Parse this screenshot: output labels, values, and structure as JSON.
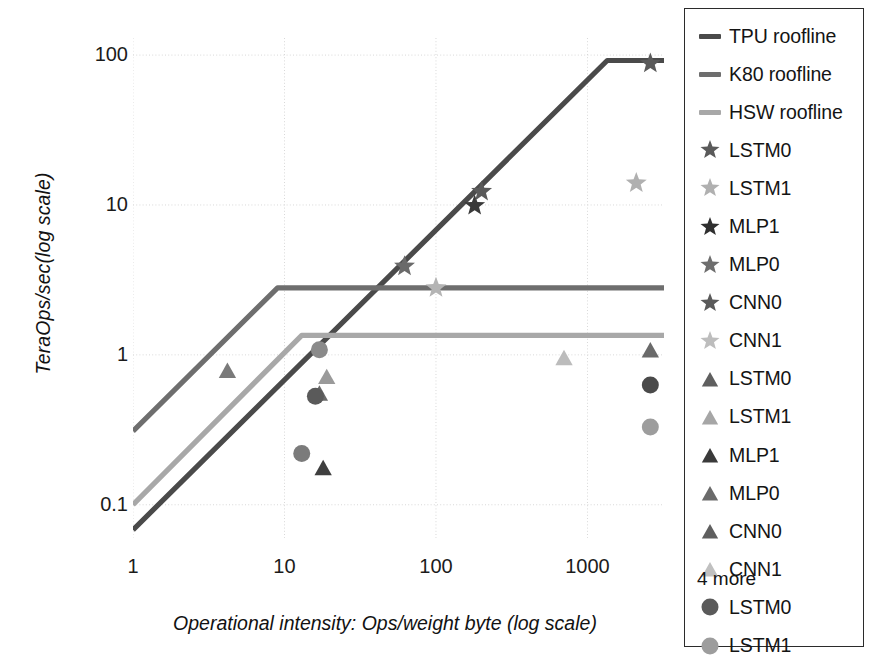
{
  "chart_data": {
    "type": "line",
    "title": "",
    "xlabel": "Operational intensity: Ops/weight byte (log scale)",
    "ylabel": "TeraOps/sec(log scale)",
    "xscale": "log",
    "yscale": "log",
    "xlim": [
      1,
      3200
    ],
    "ylim": [
      0.06,
      130
    ],
    "xticks": [
      "1",
      "10",
      "100",
      "1000"
    ],
    "xtick_values": [
      1,
      10,
      100,
      1000
    ],
    "yticks": [
      "100",
      "10",
      "1",
      "0.1"
    ],
    "ytick_values": [
      100,
      10,
      1,
      0.1
    ],
    "grid": true,
    "legend_position": "right-outside",
    "rooflines": [
      {
        "name": "TPU roofline",
        "color": "#4a4a4a",
        "peak": 92,
        "ridge_x": 1350,
        "slope_start": [
          1,
          0.068
        ],
        "knee": [
          1350,
          92
        ],
        "end": [
          3200,
          92
        ]
      },
      {
        "name": "K80 roofline",
        "color": "#6e6e6e",
        "peak": 2.8,
        "ridge_x": 9,
        "slope_start": [
          1,
          0.31
        ],
        "knee": [
          9,
          2.8
        ],
        "end": [
          3200,
          2.8
        ]
      },
      {
        "name": "HSW roofline",
        "color": "#a8a8a8",
        "peak": 1.35,
        "ridge_x": 13,
        "slope_start": [
          1,
          0.1
        ],
        "knee": [
          13,
          1.35
        ],
        "end": [
          3200,
          1.35
        ]
      }
    ],
    "series": [
      {
        "name": "LSTM0",
        "marker": "star",
        "platform": "TPU",
        "color": "#5a5a5a",
        "points": [
          [
            2600,
            88
          ]
        ]
      },
      {
        "name": "LSTM1",
        "marker": "star",
        "platform": "TPU",
        "color": "#b0b0b0",
        "points": [
          [
            2100,
            14
          ]
        ]
      },
      {
        "name": "MLP1",
        "marker": "star",
        "platform": "TPU",
        "color": "#3a3a3a",
        "points": [
          [
            180,
            9.9
          ]
        ]
      },
      {
        "name": "MLP0",
        "marker": "star",
        "platform": "TPU",
        "color": "#5a5a5a",
        "points": [
          [
            200,
            12.3
          ]
        ]
      },
      {
        "name": "CNN0",
        "marker": "star",
        "platform": "TPU",
        "color": "#6a6a6a",
        "points": [
          [
            62,
            3.9
          ]
        ]
      },
      {
        "name": "CNN1",
        "marker": "star",
        "platform": "TPU",
        "color": "#b4b4b4",
        "points": [
          [
            100,
            2.8
          ]
        ]
      },
      {
        "name": "LSTM0",
        "marker": "triangle",
        "platform": "HSW",
        "color": "#6a6a6a",
        "points": [
          [
            17,
            0.55
          ]
        ]
      },
      {
        "name": "LSTM1",
        "marker": "triangle",
        "platform": "HSW",
        "color": "#9a9a9a",
        "points": [
          [
            19,
            0.71
          ]
        ]
      },
      {
        "name": "MLP1",
        "marker": "triangle",
        "platform": "HSW",
        "color": "#3f3f3f",
        "points": [
          [
            18,
            0.175
          ]
        ]
      },
      {
        "name": "MLP0",
        "marker": "triangle",
        "platform": "HSW",
        "color": "#6a6a6a",
        "points": [
          [
            2600,
            1.07
          ]
        ]
      },
      {
        "name": "CNN0",
        "marker": "triangle",
        "platform": "HSW",
        "color": "#7a7a7a",
        "points": [
          [
            4.2,
            0.78
          ]
        ]
      },
      {
        "name": "CNN1",
        "marker": "triangle",
        "platform": "HSW",
        "color": "#bcbcbc",
        "points": [
          [
            700,
            0.95
          ]
        ]
      },
      {
        "name": "LSTM0",
        "marker": "circle",
        "platform": "K80",
        "color": "#4a4a4a",
        "points": [
          [
            2600,
            0.63
          ]
        ]
      },
      {
        "name": "LSTM1",
        "marker": "circle",
        "platform": "K80",
        "color": "#9d9d9d",
        "points": [
          [
            2600,
            0.33
          ]
        ]
      },
      {
        "name": "MLP1",
        "marker": "circle",
        "platform": "K80",
        "color": "#5a5a5a",
        "points": [
          [
            16,
            0.53
          ]
        ]
      },
      {
        "name": "MLP0",
        "marker": "circle",
        "platform": "K80",
        "color": "#7b7b7b",
        "points": [
          [
            13,
            0.22
          ]
        ]
      },
      {
        "name": "CNN0",
        "marker": "circle",
        "platform": "K80",
        "color": "#8a8a8a",
        "points": [
          [
            17,
            1.08
          ]
        ]
      }
    ]
  },
  "axis": {
    "ylabel": "TeraOps/sec(log scale)",
    "xlabel": "Operational intensity: Ops/weight byte (log scale)",
    "yticks": [
      "100",
      "10",
      "1",
      "0.1"
    ],
    "xticks": [
      "1",
      "10",
      "100",
      "1000"
    ]
  },
  "legend": {
    "more_label": "4 more",
    "items": [
      {
        "label": "TPU roofline",
        "key": "line-swatch",
        "color": "#4a4a4a"
      },
      {
        "label": "K80 roofline",
        "key": "line-swatch",
        "color": "#6e6e6e"
      },
      {
        "label": "HSW roofline",
        "key": "line-swatch",
        "color": "#a8a8a8"
      },
      {
        "label": "LSTM0",
        "key": "star-marker",
        "color": "#5a5a5a"
      },
      {
        "label": "LSTM1",
        "key": "star-marker",
        "color": "#b0b0b0"
      },
      {
        "label": "MLP1",
        "key": "star-marker",
        "color": "#2f2f2f"
      },
      {
        "label": "MLP0",
        "key": "star-marker",
        "color": "#6e6e6e"
      },
      {
        "label": "CNN0",
        "key": "star-marker",
        "color": "#5a5a5a"
      },
      {
        "label": "CNN1",
        "key": "star-marker",
        "color": "#bdbdbd"
      },
      {
        "label": "LSTM0",
        "key": "triangle-marker",
        "color": "#5f5f5f"
      },
      {
        "label": "LSTM1",
        "key": "triangle-marker",
        "color": "#a6a6a6"
      },
      {
        "label": "MLP1",
        "key": "triangle-marker",
        "color": "#3a3a3a"
      },
      {
        "label": "MLP0",
        "key": "triangle-marker",
        "color": "#6a6a6a"
      },
      {
        "label": "CNN0",
        "key": "triangle-marker",
        "color": "#5f5f5f"
      },
      {
        "label": "CNN1",
        "key": "triangle-marker",
        "color": "#c0c0c0"
      },
      {
        "label": "LSTM0",
        "key": "circle-marker",
        "color": "#5a5a5a"
      },
      {
        "label": "LSTM1",
        "key": "circle-marker",
        "color": "#9d9d9d"
      }
    ]
  },
  "colors": {
    "tpu": "#4a4a4a",
    "k80": "#6e6e6e",
    "hsw": "#a8a8a8",
    "grid": "#d8d8d8",
    "text": "#141414",
    "background": "#ffffff"
  }
}
